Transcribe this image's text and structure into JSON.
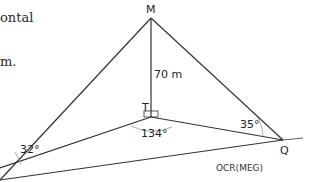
{
  "text_fragments": [
    "ontal",
    "m."
  ],
  "diagram": {
    "points": {
      "M": "M",
      "T": "T",
      "Q": "Q"
    },
    "labels": {
      "height": "70 m",
      "angle_left": "32°",
      "angle_T": "134°",
      "angle_Q": "35°"
    },
    "source": "OCR(MEG)"
  }
}
